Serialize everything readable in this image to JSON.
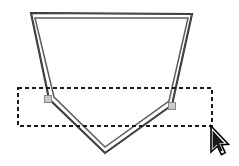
{
  "canvas": {
    "width": 239,
    "height": 166,
    "background_color": "#ffffff",
    "tool": "selection-marquee"
  },
  "shape": {
    "name": "pentagon-polygon",
    "stroke_color": "#2b2b2b",
    "stroke_color_light": "#7a7a7a",
    "fill": "none",
    "style": "double-stroke-outline",
    "outer_points": "31,13 192,14 172,105 105,153 49,99",
    "inner_points": "35,18 188,18 169,101 105,147 54,97",
    "vertices": [
      {
        "name": "vertex-top-left",
        "x": 31,
        "y": 13
      },
      {
        "name": "vertex-top-right",
        "x": 192,
        "y": 14
      },
      {
        "name": "vertex-right",
        "x": 172,
        "y": 105
      },
      {
        "name": "vertex-bottom",
        "x": 105,
        "y": 153
      },
      {
        "name": "vertex-left",
        "x": 49,
        "y": 99
      }
    ]
  },
  "marquee": {
    "name": "dashed-selection-rectangle",
    "x": 18,
    "y": 88,
    "width": 194,
    "height": 38,
    "stroke_color": "#1a1a1a",
    "dash_pattern": "4 3",
    "fill": "none"
  },
  "handles": [
    {
      "name": "selection-handle-left",
      "x": 48,
      "y": 99,
      "size": 7,
      "fill": "#c9c9c9",
      "stroke": "#8a8a8a"
    },
    {
      "name": "selection-handle-right",
      "x": 172,
      "y": 106,
      "size": 7,
      "fill": "#c9c9c9",
      "stroke": "#8a8a8a"
    }
  ],
  "cursor": {
    "name": "mouse-arrow-cursor",
    "tip_x": 211,
    "tip_y": 126,
    "fill": "#ffffff",
    "stroke": "#000000"
  }
}
